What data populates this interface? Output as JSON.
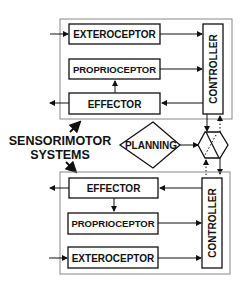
{
  "diagram": {
    "top_system": {
      "exteroceptor": "EXTEROCEPTOR",
      "proprioceptor": "PROPRIOCEPTOR",
      "effector": "EFFECTOR",
      "controller": "CONTROLLER"
    },
    "bottom_system": {
      "effector": "EFFECTOR",
      "proprioceptor": "PROPRIOCEPTOR",
      "exteroceptor": "EXTEROCEPTOR",
      "controller": "CONTROLLER"
    },
    "caption_line1": "SENSORIMOTOR",
    "caption_line2": "SYSTEMS",
    "planning": "PLANNING",
    "colors": {
      "stroke": "#111111",
      "outer_box": "#888888",
      "background": "#ffffff"
    }
  }
}
